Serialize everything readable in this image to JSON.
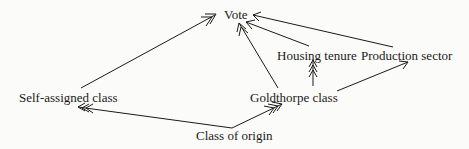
{
  "diagram": {
    "type": "path-diagram",
    "nodes": {
      "vote": "Vote",
      "housing_tenure": "Housing tenure",
      "production_sector": "Production sector",
      "self_assigned_class": "Self-assigned class",
      "goldthorpe_class": "Goldthorpe class",
      "class_of_origin": "Class of origin"
    },
    "edges": [
      {
        "from": "Self-assigned class",
        "to": "Vote",
        "arrowheads": 1
      },
      {
        "from": "Goldthorpe class",
        "to": "Vote",
        "arrowheads": 1
      },
      {
        "from": "Housing tenure",
        "to": "Vote",
        "arrowheads": 1
      },
      {
        "from": "Production sector",
        "to": "Vote",
        "arrowheads": 1
      },
      {
        "from": "Goldthorpe class",
        "to": "Housing tenure",
        "arrowheads": 3
      },
      {
        "from": "Goldthorpe class",
        "to": "Production sector",
        "arrowheads": 1
      },
      {
        "from": "Class of origin",
        "to": "Self-assigned class",
        "arrowheads": 3
      },
      {
        "from": "Class of origin",
        "to": "Goldthorpe class",
        "arrowheads": 3
      }
    ],
    "line_color": "#1a1a1a",
    "background": "#fbfbf9"
  }
}
